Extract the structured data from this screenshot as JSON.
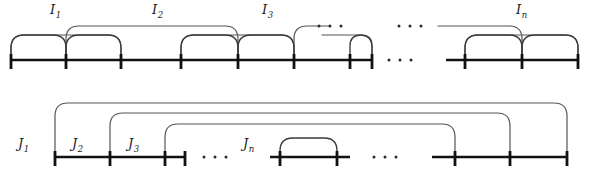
{
  "figure": {
    "background": "#ffffff",
    "line_color": "#111111",
    "arc_color": "#3a3a3a",
    "width": 589,
    "height": 181
  },
  "rows": [
    {
      "id": "top-row",
      "name": "I-intervals",
      "labels": [
        {
          "base": "I",
          "sub": "1",
          "x": 50,
          "y": 14
        },
        {
          "base": "I",
          "sub": "2",
          "x": 152,
          "y": 14
        },
        {
          "base": "I",
          "sub": "3",
          "x": 262,
          "y": 14
        },
        {
          "base": "I",
          "sub": "n",
          "x": 516,
          "y": 14
        }
      ],
      "ellipses": [
        {
          "name": "ellipsis-upper-left",
          "x": 330,
          "y": 26
        },
        {
          "name": "ellipsis-upper-right",
          "x": 410,
          "y": 26
        },
        {
          "name": "ellipsis-baseline",
          "x": 400,
          "y": 60
        }
      ]
    },
    {
      "id": "bottom-row",
      "name": "J-intervals",
      "labels": [
        {
          "base": "J",
          "sub": "1",
          "x": 18,
          "y": 148
        },
        {
          "base": "J",
          "sub": "2",
          "x": 72,
          "y": 148
        },
        {
          "base": "J",
          "sub": "3",
          "x": 128,
          "y": 148
        },
        {
          "base": "J",
          "sub": "n",
          "x": 243,
          "y": 148
        }
      ],
      "ellipses": [
        {
          "name": "ellipsis-baseline-left",
          "x": 215,
          "y": 157
        },
        {
          "name": "ellipsis-baseline-right",
          "x": 385,
          "y": 157
        }
      ]
    }
  ],
  "top": {
    "baseline_y": 60,
    "segments": [
      {
        "name": "baseline-segment-left",
        "x1": 11,
        "x2": 372
      },
      {
        "name": "baseline-segment-right",
        "x1": 446,
        "x2": 578
      }
    ],
    "ticks": [
      11,
      66,
      121,
      181,
      238,
      294,
      350,
      372,
      465,
      522,
      578
    ],
    "arcs_low": [
      {
        "name": "arc-low-1",
        "x1": 11,
        "x2": 66,
        "top": 35
      },
      {
        "name": "arc-low-2",
        "x1": 66,
        "x2": 121,
        "top": 35
      },
      {
        "name": "arc-low-3",
        "x1": 181,
        "x2": 238,
        "top": 35
      },
      {
        "name": "arc-low-4",
        "x1": 238,
        "x2": 294,
        "top": 35
      },
      {
        "name": "arc-low-5",
        "x1": 350,
        "x2": 372,
        "top": 35
      },
      {
        "name": "arc-low-6",
        "x1": 465,
        "x2": 522,
        "top": 35
      },
      {
        "name": "arc-low-7",
        "x1": 522,
        "x2": 578,
        "top": 35
      }
    ],
    "arcs_high": [
      {
        "name": "arc-high-1",
        "x1": 11,
        "x2": 121,
        "top": 35,
        "left_open": false,
        "right_open": false
      },
      {
        "name": "arc-high-2",
        "x1": 66,
        "x2": 238,
        "top": 26,
        "left_open": false,
        "right_open": false
      },
      {
        "name": "arc-high-3",
        "x1": 181,
        "x2": 294,
        "top": 35,
        "left_open": false,
        "right_open": false
      },
      {
        "name": "arc-high-4",
        "x1": 294,
        "x2": 330,
        "top": 26,
        "left_open": false,
        "right_open": true
      },
      {
        "name": "arc-high-5",
        "x1": 322,
        "x2": 372,
        "top": 35,
        "left_open": true,
        "right_open": false
      },
      {
        "name": "arc-high-6",
        "x1": 438,
        "x2": 522,
        "top": 26,
        "left_open": true,
        "right_open": false
      },
      {
        "name": "arc-high-7",
        "x1": 465,
        "x2": 578,
        "top": 35,
        "left_open": false,
        "right_open": false
      }
    ]
  },
  "bottom": {
    "baseline_y": 157,
    "segments": [
      {
        "name": "baseline-segment-left",
        "x1": 55,
        "x2": 185
      },
      {
        "name": "baseline-segment-mid",
        "x1": 270,
        "x2": 350
      },
      {
        "name": "baseline-segment-right",
        "x1": 432,
        "x2": 567
      }
    ],
    "ticks": [
      55,
      110,
      165,
      185,
      280,
      337,
      455,
      510,
      567
    ],
    "arcs_low": [
      {
        "name": "arc-low-jn",
        "x1": 280,
        "x2": 337,
        "top": 138
      }
    ],
    "arcs_nested": [
      {
        "name": "arc-nested-1",
        "x1": 55,
        "x2": 567,
        "top": 103
      },
      {
        "name": "arc-nested-2",
        "x1": 110,
        "x2": 510,
        "top": 113
      },
      {
        "name": "arc-nested-3",
        "x1": 165,
        "x2": 455,
        "top": 124
      }
    ]
  }
}
